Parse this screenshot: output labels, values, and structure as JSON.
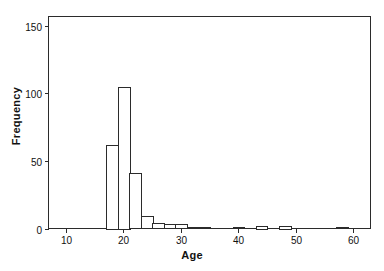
{
  "chart_data": {
    "type": "bar",
    "title": "",
    "subtitle": "",
    "xlabel": "Age",
    "ylabel": "Frequency",
    "xlim": [
      7,
      63
    ],
    "ylim": [
      0,
      157
    ],
    "grid": false,
    "legend": null,
    "bin_width": 2,
    "xticks": [
      10,
      20,
      30,
      40,
      50,
      60
    ],
    "xtick_labels": [
      "10",
      "20",
      "30",
      "40",
      "50",
      "60"
    ],
    "yticks": [
      0,
      50,
      100,
      150
    ],
    "ytick_labels": [
      "0",
      "50",
      "100",
      "150"
    ],
    "bin_starts": [
      17,
      19,
      21,
      23,
      25,
      27,
      29,
      31,
      33,
      39,
      43,
      47,
      57
    ],
    "values": [
      62,
      105,
      41,
      9,
      4,
      3,
      3,
      1,
      1,
      1,
      2,
      2,
      1
    ],
    "bars": [
      {
        "x0": 17,
        "x1": 19,
        "y": 62
      },
      {
        "x0": 19,
        "x1": 21,
        "y": 105
      },
      {
        "x0": 21,
        "x1": 23,
        "y": 41
      },
      {
        "x0": 23,
        "x1": 25,
        "y": 9
      },
      {
        "x0": 25,
        "x1": 27,
        "y": 4
      },
      {
        "x0": 27,
        "x1": 29,
        "y": 3
      },
      {
        "x0": 29,
        "x1": 31,
        "y": 3
      },
      {
        "x0": 31,
        "x1": 33,
        "y": 1
      },
      {
        "x0": 33,
        "x1": 35,
        "y": 1
      },
      {
        "x0": 39,
        "x1": 41,
        "y": 1
      },
      {
        "x0": 43,
        "x1": 45,
        "y": 2
      },
      {
        "x0": 47,
        "x1": 49,
        "y": 2
      },
      {
        "x0": 57,
        "x1": 59,
        "y": 1
      }
    ],
    "colors": {
      "bar_fill": "#ffffff",
      "bar_edge": "#2b2b2b",
      "axis": "#2b2b2b",
      "text": "#111111",
      "background": "#ffffff"
    }
  }
}
